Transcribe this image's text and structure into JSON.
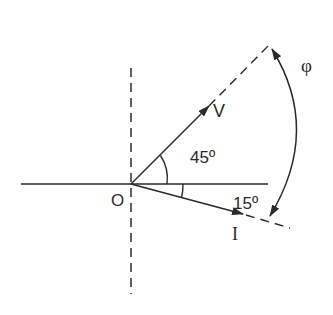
{
  "diagram": {
    "colors": {
      "stroke": "#2a2a2a",
      "background": "#ffffff"
    },
    "origin": {
      "label": "O",
      "x": 131,
      "y": 184
    },
    "axes": {
      "horizontal": {
        "style": "solid",
        "x1": 21,
        "x2": 268
      },
      "vertical": {
        "style": "dashed",
        "y1": 68,
        "y2": 294
      }
    },
    "phasors": [
      {
        "name": "voltage",
        "label": "V",
        "angle_deg": 45,
        "angle_label": "45º",
        "direction": "above reference"
      },
      {
        "name": "current",
        "label": "I",
        "angle_deg": -15,
        "angle_label": "15º",
        "direction": "below reference"
      }
    ],
    "phase_difference": {
      "label": "φ",
      "description": "angle between V and I (45º + 15º)"
    }
  }
}
